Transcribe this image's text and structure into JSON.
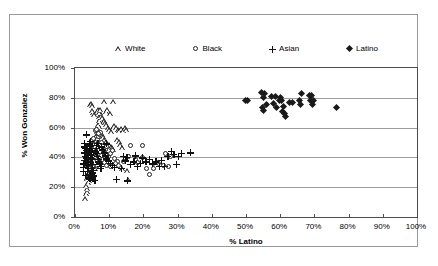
{
  "chart_data": {
    "type": "scatter",
    "title": "",
    "xlabel": "% Latino",
    "ylabel": "% Won Gonzalez",
    "xlim": [
      0,
      100
    ],
    "ylim": [
      0,
      100
    ],
    "grid": "horizontal",
    "legend_position": "top",
    "x_ticks": [
      "0%",
      "10%",
      "20%",
      "30%",
      "40%",
      "50%",
      "60%",
      "70%",
      "80%",
      "90%",
      "100%"
    ],
    "x_tick_values": [
      0,
      10,
      20,
      30,
      40,
      50,
      60,
      70,
      80,
      90,
      100
    ],
    "y_ticks": [
      "0%",
      "20%",
      "40%",
      "60%",
      "80%",
      "100%"
    ],
    "y_tick_values": [
      0,
      20,
      40,
      60,
      80,
      100
    ],
    "series": [
      {
        "name": "White",
        "marker": "triangle",
        "marker_filled": false,
        "color": "#222222",
        "points": [
          [
            3.0,
            12.0
          ],
          [
            3.2,
            15.5
          ],
          [
            3.4,
            17.0
          ],
          [
            3.6,
            19.0
          ],
          [
            3.3,
            21.0
          ],
          [
            3.8,
            22.5
          ],
          [
            4.0,
            24.0
          ],
          [
            3.5,
            25.5
          ],
          [
            4.2,
            26.5
          ],
          [
            3.9,
            28.0
          ],
          [
            4.4,
            29.0
          ],
          [
            4.1,
            30.5
          ],
          [
            4.6,
            31.5
          ],
          [
            4.3,
            33.0
          ],
          [
            4.8,
            34.0
          ],
          [
            4.5,
            35.5
          ],
          [
            5.0,
            36.5
          ],
          [
            4.7,
            38.0
          ],
          [
            5.2,
            39.0
          ],
          [
            4.9,
            40.5
          ],
          [
            5.4,
            41.5
          ],
          [
            5.1,
            43.0
          ],
          [
            5.6,
            44.0
          ],
          [
            5.3,
            45.5
          ],
          [
            5.8,
            46.5
          ],
          [
            5.5,
            47.5
          ],
          [
            6.0,
            48.5
          ],
          [
            5.7,
            50.0
          ],
          [
            6.2,
            51.0
          ],
          [
            5.9,
            52.0
          ],
          [
            6.4,
            53.5
          ],
          [
            6.1,
            54.5
          ],
          [
            6.6,
            55.5
          ],
          [
            6.3,
            57.0
          ],
          [
            6.8,
            58.0
          ],
          [
            6.5,
            59.5
          ],
          [
            7.0,
            60.5
          ],
          [
            6.7,
            62.0
          ],
          [
            7.2,
            63.0
          ],
          [
            6.9,
            64.5
          ],
          [
            7.4,
            65.5
          ],
          [
            7.1,
            67.0
          ],
          [
            7.6,
            68.0
          ],
          [
            7.3,
            69.5
          ],
          [
            4.3,
            75.5
          ],
          [
            4.6,
            76.0
          ],
          [
            4.9,
            74.5
          ],
          [
            5.2,
            69.5
          ],
          [
            5.5,
            68.5
          ],
          [
            5.0,
            71.0
          ],
          [
            6.3,
            70.5
          ],
          [
            6.6,
            71.5
          ],
          [
            7.0,
            70.0
          ],
          [
            7.4,
            72.0
          ],
          [
            8.6,
            77.5
          ],
          [
            9.0,
            70.5
          ],
          [
            9.4,
            71.5
          ],
          [
            10.2,
            69.0
          ],
          [
            11.0,
            77.5
          ],
          [
            8.0,
            66.5
          ],
          [
            8.4,
            64.5
          ],
          [
            8.8,
            63.0
          ],
          [
            9.2,
            61.5
          ],
          [
            9.6,
            60.0
          ],
          [
            10.0,
            58.5
          ],
          [
            10.5,
            57.0
          ],
          [
            11.0,
            59.5
          ],
          [
            11.5,
            61.0
          ],
          [
            12.0,
            60.0
          ],
          [
            12.5,
            58.5
          ],
          [
            13.0,
            57.5
          ],
          [
            13.5,
            59.0
          ],
          [
            14.0,
            58.0
          ],
          [
            14.5,
            59.5
          ],
          [
            15.0,
            58.5
          ],
          [
            7.8,
            55.0
          ],
          [
            8.2,
            53.5
          ],
          [
            8.6,
            52.0
          ],
          [
            9.0,
            50.5
          ],
          [
            9.4,
            49.0
          ],
          [
            9.8,
            48.0
          ],
          [
            10.4,
            47.0
          ],
          [
            10.8,
            46.0
          ],
          [
            11.2,
            45.0
          ],
          [
            12.2,
            52.0
          ],
          [
            12.8,
            50.5
          ],
          [
            13.2,
            48.0
          ],
          [
            13.8,
            46.0
          ],
          [
            6.2,
            41.0
          ],
          [
            6.8,
            40.0
          ],
          [
            7.2,
            38.5
          ],
          [
            7.6,
            37.0
          ],
          [
            8.0,
            36.0
          ],
          [
            5.4,
            33.5
          ],
          [
            5.8,
            32.0
          ],
          [
            4.4,
            30.0
          ],
          [
            4.8,
            28.5
          ],
          [
            3.6,
            26.0
          ],
          [
            13.6,
            32.5
          ],
          [
            15.2,
            31.0
          ],
          [
            23.8,
            35.5
          ],
          [
            24.6,
            36.0
          ],
          [
            15.4,
            24.5
          ]
        ]
      },
      {
        "name": "Black",
        "marker": "circle",
        "marker_filled": false,
        "color": "#222222",
        "points": [
          [
            3.8,
            34.0
          ],
          [
            4.1,
            36.0
          ],
          [
            4.4,
            38.5
          ],
          [
            4.7,
            40.0
          ],
          [
            5.0,
            42.0
          ],
          [
            5.3,
            44.0
          ],
          [
            5.6,
            45.5
          ],
          [
            5.9,
            47.0
          ],
          [
            6.2,
            49.0
          ],
          [
            6.5,
            50.5
          ],
          [
            6.8,
            52.0
          ],
          [
            7.1,
            53.5
          ],
          [
            7.4,
            55.0
          ],
          [
            7.7,
            56.5
          ],
          [
            6.0,
            57.5
          ],
          [
            6.4,
            58.5
          ],
          [
            5.1,
            51.0
          ],
          [
            5.4,
            48.0
          ],
          [
            4.2,
            44.5
          ],
          [
            4.5,
            42.5
          ],
          [
            3.6,
            40.0
          ],
          [
            3.9,
            38.0
          ],
          [
            4.8,
            35.0
          ],
          [
            5.2,
            33.5
          ],
          [
            6.6,
            34.0
          ],
          [
            7.0,
            36.0
          ],
          [
            7.5,
            39.5
          ],
          [
            8.0,
            41.0
          ],
          [
            8.5,
            43.0
          ],
          [
            9.0,
            45.0
          ],
          [
            9.5,
            47.0
          ],
          [
            8.2,
            38.5
          ],
          [
            8.8,
            36.5
          ],
          [
            9.4,
            34.5
          ],
          [
            10.0,
            40.0
          ],
          [
            10.6,
            42.0
          ],
          [
            11.2,
            44.5
          ],
          [
            11.8,
            39.0
          ],
          [
            12.5,
            37.0
          ],
          [
            16.4,
            47.5
          ],
          [
            19.8,
            47.5
          ],
          [
            15.8,
            40.0
          ],
          [
            17.8,
            38.5
          ],
          [
            20.0,
            39.5
          ],
          [
            22.0,
            28.5
          ],
          [
            23.0,
            32.0
          ],
          [
            26.5,
            42.0
          ],
          [
            28.2,
            40.5
          ],
          [
            26.0,
            34.0
          ],
          [
            27.5,
            33.5
          ],
          [
            24.0,
            36.5
          ],
          [
            21.0,
            32.0
          ],
          [
            18.5,
            36.0
          ],
          [
            14.2,
            37.0
          ],
          [
            13.0,
            34.5
          ],
          [
            12.0,
            35.5
          ],
          [
            10.4,
            33.5
          ],
          [
            9.8,
            36.0
          ],
          [
            7.8,
            50.0
          ],
          [
            6.9,
            55.5
          ],
          [
            5.7,
            52.5
          ]
        ]
      },
      {
        "name": "Asian",
        "marker": "plus",
        "marker_filled": true,
        "color": "#111111",
        "points": [
          [
            2.4,
            36.0
          ],
          [
            2.6,
            38.5
          ],
          [
            2.8,
            41.0
          ],
          [
            2.5,
            43.5
          ],
          [
            3.0,
            46.5
          ],
          [
            2.7,
            47.5
          ],
          [
            3.2,
            45.0
          ],
          [
            3.4,
            42.5
          ],
          [
            3.1,
            40.0
          ],
          [
            3.6,
            37.5
          ],
          [
            3.3,
            35.0
          ],
          [
            3.8,
            33.0
          ],
          [
            3.5,
            31.0
          ],
          [
            4.0,
            29.0
          ],
          [
            3.7,
            27.0
          ],
          [
            4.2,
            26.0
          ],
          [
            2.9,
            28.5
          ],
          [
            3.9,
            44.0
          ],
          [
            4.1,
            46.0
          ],
          [
            4.4,
            48.0
          ],
          [
            4.6,
            45.0
          ],
          [
            4.3,
            42.0
          ],
          [
            4.8,
            39.5
          ],
          [
            4.5,
            37.0
          ],
          [
            5.0,
            35.5
          ],
          [
            4.7,
            33.0
          ],
          [
            5.2,
            31.5
          ],
          [
            4.9,
            30.0
          ],
          [
            5.4,
            28.0
          ],
          [
            5.1,
            26.5
          ],
          [
            5.6,
            25.0
          ],
          [
            3.2,
            55.5
          ],
          [
            4.0,
            49.5
          ],
          [
            4.4,
            51.0
          ],
          [
            5.8,
            44.0
          ],
          [
            6.0,
            46.5
          ],
          [
            6.2,
            43.0
          ],
          [
            6.4,
            41.0
          ],
          [
            6.6,
            39.0
          ],
          [
            6.8,
            37.5
          ],
          [
            7.0,
            36.0
          ],
          [
            7.2,
            34.5
          ],
          [
            7.4,
            33.0
          ],
          [
            6.1,
            48.5
          ],
          [
            6.5,
            50.0
          ],
          [
            7.6,
            47.5
          ],
          [
            8.0,
            45.5
          ],
          [
            8.4,
            43.5
          ],
          [
            8.8,
            41.5
          ],
          [
            9.2,
            39.5
          ],
          [
            9.6,
            38.0
          ],
          [
            10.2,
            36.5
          ],
          [
            10.8,
            35.0
          ],
          [
            11.4,
            33.5
          ],
          [
            9.0,
            49.5
          ],
          [
            12.0,
            25.5
          ],
          [
            15.2,
            24.5
          ],
          [
            13.4,
            33.0
          ],
          [
            14.0,
            41.0
          ],
          [
            14.6,
            38.0
          ],
          [
            15.0,
            40.5
          ],
          [
            16.0,
            35.5
          ],
          [
            17.0,
            37.5
          ],
          [
            18.0,
            34.5
          ],
          [
            19.0,
            36.5
          ],
          [
            20.5,
            37.5
          ],
          [
            22.5,
            36.0
          ],
          [
            23.5,
            37.5
          ],
          [
            25.0,
            38.5
          ],
          [
            26.0,
            34.5
          ],
          [
            27.0,
            41.0
          ],
          [
            28.0,
            44.5
          ],
          [
            28.8,
            42.5
          ],
          [
            30.0,
            41.0
          ],
          [
            31.0,
            43.0
          ],
          [
            33.5,
            43.5
          ],
          [
            29.5,
            35.5
          ],
          [
            24.5,
            34.5
          ],
          [
            21.5,
            39.0
          ],
          [
            19.5,
            40.0
          ],
          [
            17.5,
            41.5
          ],
          [
            2.3,
            33.5
          ],
          [
            2.2,
            31.0
          ],
          [
            2.6,
            50.0
          ]
        ]
      },
      {
        "name": "Latino",
        "marker": "diamond",
        "marker_filled": true,
        "color": "#1a1a1a",
        "points": [
          [
            49.8,
            78.5
          ],
          [
            50.5,
            78.5
          ],
          [
            54.5,
            83.5
          ],
          [
            55.3,
            83.0
          ],
          [
            55.0,
            80.0
          ],
          [
            54.8,
            73.5
          ],
          [
            55.2,
            71.5
          ],
          [
            56.0,
            75.5
          ],
          [
            57.5,
            81.0
          ],
          [
            58.5,
            81.0
          ],
          [
            58.0,
            76.0
          ],
          [
            58.8,
            73.5
          ],
          [
            59.8,
            78.0
          ],
          [
            60.5,
            78.0
          ],
          [
            60.0,
            80.5
          ],
          [
            60.8,
            70.5
          ],
          [
            61.2,
            69.5
          ],
          [
            61.5,
            67.5
          ],
          [
            61.0,
            74.0
          ],
          [
            62.8,
            77.0
          ],
          [
            63.5,
            77.0
          ],
          [
            65.5,
            78.0
          ],
          [
            66.3,
            83.0
          ],
          [
            66.0,
            75.5
          ],
          [
            68.5,
            81.5
          ],
          [
            69.2,
            81.5
          ],
          [
            69.0,
            78.5
          ],
          [
            69.6,
            78.0
          ],
          [
            69.3,
            75.5
          ],
          [
            76.5,
            73.5
          ]
        ]
      }
    ]
  },
  "legend": {
    "items": [
      {
        "label": "White",
        "marker": "triangle-icon"
      },
      {
        "label": "Black",
        "marker": "circle-icon"
      },
      {
        "label": "Asian",
        "marker": "plus-icon"
      },
      {
        "label": "Latino",
        "marker": "diamond-icon"
      }
    ]
  },
  "axis_titles": {
    "x": "% Latino",
    "y": "% Won Gonzalez"
  }
}
